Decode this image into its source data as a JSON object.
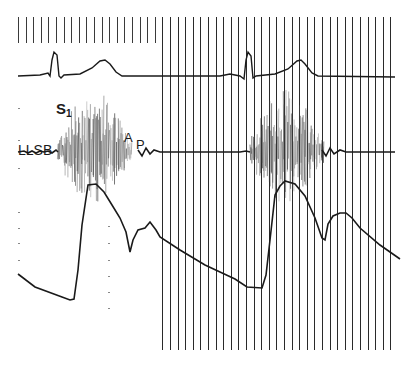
{
  "labels": {
    "lead": "LLSB",
    "s1_main": "S",
    "s1_sub": "1",
    "a2": "A",
    "p2": "P"
  },
  "colors": {
    "trace": "#1a1a1a",
    "grid": "#2a2a2a",
    "murmur": "#555555",
    "background": "#ffffff"
  },
  "chart_data": {
    "type": "line",
    "title": "",
    "xlabel": "",
    "ylabel": "",
    "grid": {
      "time_markers_top": true,
      "vertical_lines_from_x": 162,
      "spacing_px": 7.6
    },
    "annotations": [
      "LLSB",
      "S1",
      "A",
      "P"
    ],
    "series": [
      {
        "name": "ECG",
        "baseline_y": 76,
        "events": [
          {
            "type": "QRS",
            "x": 54,
            "peak_y": 52
          },
          {
            "type": "T",
            "x": 104,
            "peak_y": 60
          },
          {
            "type": "QRS",
            "x": 248,
            "peak_y": 52
          },
          {
            "type": "T",
            "x": 300,
            "peak_y": 60
          }
        ]
      },
      {
        "name": "LLSB phonocardiogram",
        "baseline_y": 152,
        "events": [
          {
            "type": "S1",
            "x": 60
          },
          {
            "type": "systolic murmur",
            "x_start": 60,
            "x_end": 130
          },
          {
            "type": "A2",
            "x": 131
          },
          {
            "type": "P2",
            "x": 138
          },
          {
            "type": "S1",
            "x": 250
          },
          {
            "type": "systolic murmur",
            "x_start": 252,
            "x_end": 322
          }
        ]
      },
      {
        "name": "Pulse tracing",
        "points": [
          [
            18,
            274
          ],
          [
            35,
            287
          ],
          [
            62,
            297
          ],
          [
            70,
            300
          ],
          [
            74,
            299
          ],
          [
            80,
            240
          ],
          [
            88,
            185
          ],
          [
            96,
            184
          ],
          [
            104,
            192
          ],
          [
            112,
            205
          ],
          [
            122,
            225
          ],
          [
            130,
            252
          ],
          [
            134,
            236
          ],
          [
            140,
            228
          ],
          [
            150,
            222
          ],
          [
            160,
            237
          ],
          [
            180,
            250
          ],
          [
            205,
            265
          ],
          [
            220,
            272
          ],
          [
            235,
            279
          ],
          [
            247,
            287
          ],
          [
            262,
            288
          ],
          [
            270,
            254
          ],
          [
            277,
            189
          ],
          [
            285,
            181
          ],
          [
            295,
            184
          ],
          [
            305,
            196
          ],
          [
            315,
            218
          ],
          [
            325,
            240
          ],
          [
            330,
            222
          ],
          [
            336,
            214
          ],
          [
            345,
            213
          ],
          [
            360,
            228
          ],
          [
            380,
            245
          ],
          [
            400,
            259
          ]
        ]
      }
    ]
  }
}
